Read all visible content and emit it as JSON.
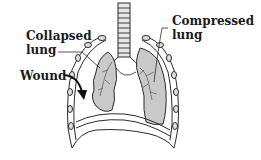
{
  "diagram": {
    "labels": {
      "collapsed_lung": {
        "line1": "Collapsed",
        "line2": "lung"
      },
      "compressed_lung": {
        "line1": "Compressed",
        "line2": "lung"
      },
      "wound": "Wound"
    },
    "colors": {
      "outline": "#2a2a2a",
      "lung_fill": "#c9c9c9",
      "background": "#ffffff",
      "text": "#1a1a1a"
    }
  }
}
